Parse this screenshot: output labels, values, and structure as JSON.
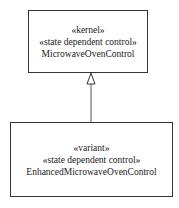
{
  "diagram": {
    "type": "uml-class-generalization",
    "classes": [
      {
        "stereotype1": "«kernel»",
        "stereotype2": "«state dependent control»",
        "name": "MicrowaveOvenControl"
      },
      {
        "stereotype1": "«variant»",
        "stereotype2": "«state dependent control»",
        "name": "EnhancedMicrowaveOvenControl"
      }
    ],
    "relationship": {
      "from": "EnhancedMicrowaveOvenControl",
      "to": "MicrowaveOvenControl",
      "kind": "generalization"
    }
  }
}
